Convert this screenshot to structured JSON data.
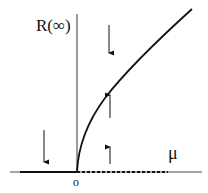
{
  "diagram": {
    "y_axis_label": "R(∞)",
    "x_axis_label": "μ",
    "origin_label": "o",
    "elements": {
      "stable_branch_left": "solid line R=0 for μ<0",
      "unstable_branch_right": "dashed line R=0 for μ>0",
      "stable_branch_curve": "R ~ sqrt(μ) for μ>0",
      "arrows": [
        {
          "position": "μ<0, above axis",
          "direction": "down"
        },
        {
          "position": "μ>0, above curve",
          "direction": "down"
        },
        {
          "position": "μ>0, below curve",
          "direction": "up"
        },
        {
          "position": "μ>0, near axis",
          "direction": "up"
        }
      ]
    },
    "colors": {
      "line": "#111111",
      "background": "#ffffff"
    }
  }
}
